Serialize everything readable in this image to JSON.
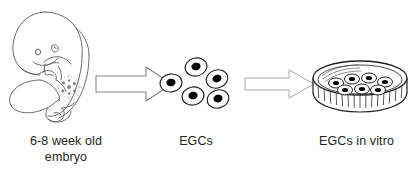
{
  "figure": {
    "width": 413,
    "height": 183,
    "background": "#ffffff",
    "ink_color": "#231f20",
    "line_color": "#58595b",
    "arrow_outline_color": "#6d6e71",
    "arrow_outline_color_light": "#a7a9ac",
    "nucleus_color": "#000000"
  },
  "stages": [
    {
      "id": "embryo",
      "icon": "human-embryo-illustration",
      "caption_lines": [
        "6-8 week old",
        "embryo"
      ],
      "detail": "gonadal-ridge-primordial-germ-cell-cluster"
    },
    {
      "id": "egcs",
      "icon": "embryonic-germ-cell-cluster",
      "caption_lines": [
        "EGCs"
      ],
      "cell_count": 5
    },
    {
      "id": "dish",
      "icon": "petri-dish-with-cells",
      "caption_lines": [
        "EGCs in vitro"
      ],
      "cell_count": 7
    }
  ],
  "arrows": [
    {
      "id": "arrow-one",
      "icon": "block-arrow-right",
      "style": "heavy"
    },
    {
      "id": "arrow-two",
      "icon": "block-arrow-right",
      "style": "light"
    }
  ],
  "captions": {
    "embryo_line1": "6-8 week old",
    "embryo_line2": "embryo",
    "egcs": "EGCs",
    "dish": "EGCs in vitro"
  }
}
